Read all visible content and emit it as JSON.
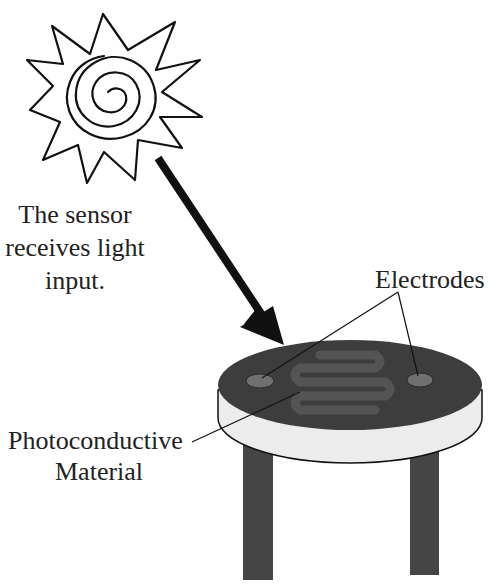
{
  "diagram": {
    "caption_lines": [
      "The sensor",
      "receives light",
      "input."
    ],
    "labels": {
      "electrodes": "Electrodes",
      "photoconductive_lines": [
        "Photoconductive",
        "Material"
      ]
    },
    "icons": {
      "sun": "sun-icon",
      "arrow": "arrow-icon"
    },
    "colors": {
      "background": "#ffffff",
      "stroke": "#111111",
      "disk_top": "#3d3d3d",
      "disk_side": "#ececec",
      "serpentine": "#5a5a5a",
      "electrode": "#6e6e6e",
      "legs": "#454545",
      "text": "#222222"
    }
  }
}
